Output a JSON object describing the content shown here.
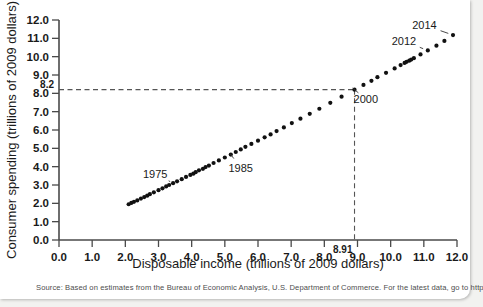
{
  "source_note": "Source: Based on estimates from the Bureau of Economic Analysis, U.S. Department of Commerce. For the latest data, go to http://bea.gov/.",
  "axes": {
    "xlabel": "Disposable income (trillions of 2009 dollars)",
    "ylabel": "Consumer spending (trillions of 2009 dollars)",
    "xticklabels": [
      "0.0",
      "1.0",
      "2.0",
      "3.0",
      "4.0",
      "5.0",
      "6.0",
      "7.0",
      "8.0",
      "9.0",
      "10.0",
      "11.0",
      "12.0"
    ],
    "yticklabels": [
      "0.0",
      "1.0",
      "2.0",
      "3.0",
      "4.0",
      "5.0",
      "6.0",
      "7.0",
      "8.0",
      "9.0",
      "10.0",
      "11.0",
      "12.0"
    ],
    "x_special_tick": "8.91",
    "y_special_tick": "8.2"
  },
  "annotations": [
    {
      "label": "1975"
    },
    {
      "label": "1985"
    },
    {
      "label": "2000"
    },
    {
      "label": "2012"
    },
    {
      "label": "2014"
    }
  ],
  "chart_data": {
    "type": "scatter",
    "title": "",
    "xlabel": "Disposable income (trillions of 2009 dollars)",
    "ylabel": "Consumer spending (trillions of 2009 dollars)",
    "xlim": [
      0.0,
      12.0
    ],
    "ylim": [
      0.0,
      12.0
    ],
    "xticks": [
      0,
      1,
      2,
      3,
      4,
      5,
      6,
      7,
      8,
      9,
      10,
      11,
      12
    ],
    "yticks": [
      0,
      1,
      2,
      3,
      4,
      5,
      6,
      7,
      8,
      9,
      10,
      11,
      12
    ],
    "grid": false,
    "legend": null,
    "reference_lines": [
      {
        "type": "horizontal",
        "value": 8.2,
        "label": "8.2",
        "style": "dashed"
      },
      {
        "type": "vertical",
        "value": 8.91,
        "label": "8.91",
        "style": "dashed"
      }
    ],
    "series": [
      {
        "name": "Disposable income vs consumer spending",
        "x": [
          2.1,
          2.18,
          2.26,
          2.36,
          2.47,
          2.57,
          2.66,
          2.74,
          2.86,
          3.0,
          3.12,
          3.23,
          3.32,
          3.44,
          3.56,
          3.7,
          3.83,
          3.96,
          4.05,
          4.12,
          4.22,
          4.34,
          4.42,
          4.52,
          4.66,
          4.82,
          5.0,
          5.18,
          5.33,
          5.48,
          5.62,
          5.8,
          6.0,
          6.2,
          6.38,
          6.56,
          6.78,
          7.02,
          7.28,
          7.56,
          7.85,
          8.18,
          8.52,
          8.91,
          9.18,
          9.42,
          9.6,
          9.86,
          10.12,
          10.3,
          10.42,
          10.48,
          10.56,
          10.62,
          10.7,
          10.9,
          11.12,
          11.38,
          11.62,
          11.88
        ],
        "y": [
          1.95,
          2.02,
          2.08,
          2.16,
          2.26,
          2.34,
          2.42,
          2.5,
          2.6,
          2.72,
          2.82,
          2.92,
          3.0,
          3.1,
          3.2,
          3.32,
          3.44,
          3.55,
          3.62,
          3.7,
          3.8,
          3.88,
          3.98,
          4.06,
          4.2,
          4.34,
          4.5,
          4.66,
          4.8,
          4.94,
          5.08,
          5.24,
          5.42,
          5.6,
          5.76,
          5.94,
          6.14,
          6.38,
          6.62,
          6.88,
          7.16,
          7.48,
          7.82,
          8.2,
          8.46,
          8.68,
          8.88,
          9.12,
          9.36,
          9.54,
          9.66,
          9.72,
          9.78,
          9.84,
          9.92,
          10.12,
          10.34,
          10.6,
          10.86,
          11.18
        ]
      }
    ],
    "point_annotations": [
      {
        "label": "1975",
        "x": 3.44,
        "y": 3.1,
        "text_x": 2.9,
        "text_y": 3.62
      },
      {
        "label": "1985",
        "x": 5.18,
        "y": 4.66,
        "text_x": 5.48,
        "text_y": 3.94
      },
      {
        "label": "2000",
        "x": 8.91,
        "y": 8.2,
        "text_x": 9.25,
        "text_y": 7.7
      },
      {
        "label": "2012",
        "x": 11.12,
        "y": 10.34,
        "text_x": 10.4,
        "text_y": 10.84
      },
      {
        "label": "2014",
        "x": 11.88,
        "y": 11.18,
        "text_x": 11.02,
        "text_y": 11.72
      }
    ]
  }
}
